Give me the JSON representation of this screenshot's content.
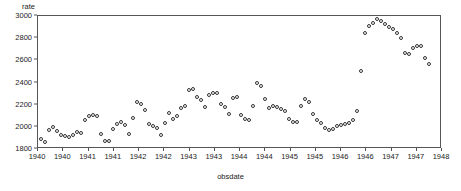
{
  "chart_data": {
    "type": "scatter",
    "title": "",
    "xlabel": "obsdate",
    "ylabel": "rate",
    "ylim": [
      1800,
      3000
    ],
    "yticks": [
      1800,
      2000,
      2200,
      2400,
      2600,
      2800,
      3000
    ],
    "ytick_labels": [
      "1800",
      "2000",
      "2200",
      "2400",
      "2600",
      "2800",
      "3000"
    ],
    "xtick_labels": [
      "1940",
      "1940",
      "1941",
      "1941",
      "1942",
      "1942",
      "1943",
      "1943",
      "1944",
      "1944",
      "1945",
      "1945",
      "1946",
      "1946",
      "1947",
      "1947",
      "1948"
    ],
    "xlim": [
      1939.83,
      1948.25
    ],
    "grid": false,
    "legend": null,
    "marker": "open-circle",
    "marker_color": "#333333",
    "x": [
      1939.92,
      1940.0,
      1940.08,
      1940.17,
      1940.25,
      1940.33,
      1940.42,
      1940.5,
      1940.58,
      1940.67,
      1940.75,
      1940.83,
      1940.92,
      1941.0,
      1941.08,
      1941.17,
      1941.25,
      1941.33,
      1941.42,
      1941.5,
      1941.58,
      1941.67,
      1941.75,
      1941.83,
      1941.92,
      1942.0,
      1942.08,
      1942.17,
      1942.25,
      1942.33,
      1942.42,
      1942.5,
      1942.58,
      1942.67,
      1942.75,
      1942.83,
      1942.92,
      1943.0,
      1943.08,
      1943.17,
      1943.25,
      1943.33,
      1943.42,
      1943.5,
      1943.58,
      1943.67,
      1943.75,
      1943.83,
      1943.92,
      1944.0,
      1944.08,
      1944.17,
      1944.25,
      1944.33,
      1944.42,
      1944.5,
      1944.58,
      1944.67,
      1944.75,
      1944.83,
      1944.92,
      1945.0,
      1945.08,
      1945.17,
      1945.25,
      1945.33,
      1945.42,
      1945.5,
      1945.58,
      1945.67,
      1945.75,
      1945.83,
      1945.92,
      1946.0,
      1946.08,
      1946.17,
      1946.25,
      1946.33,
      1946.42,
      1946.5,
      1946.58,
      1946.67,
      1946.75,
      1946.83,
      1946.92,
      1947.0,
      1947.08,
      1947.17,
      1947.25,
      1947.33,
      1947.42,
      1947.5,
      1947.58,
      1947.67,
      1947.75,
      1947.83,
      1947.92,
      1948.0
    ],
    "y": [
      1880,
      1855,
      1960,
      1985,
      1950,
      1920,
      1905,
      1900,
      1915,
      1945,
      1935,
      2050,
      2090,
      2100,
      2085,
      1930,
      1865,
      1862,
      1970,
      2020,
      2035,
      2010,
      1930,
      2075,
      2215,
      2200,
      2140,
      2015,
      2000,
      1980,
      1915,
      2030,
      2120,
      2060,
      2090,
      2165,
      2180,
      2320,
      2335,
      2260,
      2230,
      2170,
      2275,
      2300,
      2295,
      2200,
      2170,
      2110,
      2255,
      2260,
      2100,
      2060,
      2055,
      2180,
      2390,
      2360,
      2240,
      2165,
      2175,
      2170,
      2150,
      2130,
      2065,
      2035,
      2035,
      2180,
      2240,
      2215,
      2110,
      2055,
      2030,
      1980,
      1960,
      1975,
      2000,
      2005,
      2015,
      2030,
      2055,
      2130,
      2495,
      2840,
      2905,
      2930,
      2965,
      2950,
      2920,
      2890,
      2870,
      2835,
      2790,
      2660,
      2650,
      2700,
      2720,
      2720,
      2610,
      2555,
      2430
    ]
  }
}
